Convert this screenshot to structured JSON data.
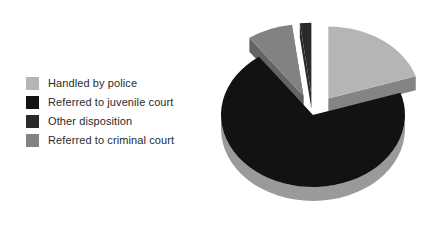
{
  "figure": {
    "background_color": "#ffffff",
    "type": "exploded-3d-pie-chart"
  },
  "legend": {
    "position": "left",
    "items": [
      {
        "label": "Handled by police",
        "color": "#b5b5b5",
        "swatch_name": "legend-swatch-handled-by-police"
      },
      {
        "label": "Referred to juvenile court",
        "color": "#121212",
        "swatch_name": "legend-swatch-referred-to-juvenile-court"
      },
      {
        "label": "Other disposition",
        "color": "#2a2a2a",
        "swatch_name": "legend-swatch-other-disposition"
      },
      {
        "label": "Referred to criminal court",
        "color": "#828282",
        "swatch_name": "legend-swatch-referred-to-criminal-court"
      }
    ]
  },
  "chart_data": {
    "type": "pie",
    "title": "",
    "subtitle": "",
    "xlabel": "",
    "ylabel": "",
    "grid": false,
    "legend_position": "left",
    "three_d": true,
    "exploded": true,
    "start_angle_deg": -90,
    "direction": "clockwise",
    "labels": [
      "Handled by police",
      "Other disposition",
      "Referred to criminal court",
      "Referred to juvenile court"
    ],
    "slices": [
      {
        "label": "Handled by police",
        "value": 20,
        "unit": "percent",
        "color": "#b5b5b5",
        "side_color": "#7d7d7d",
        "exploded": true,
        "start_angle_deg": 0,
        "end_angle_deg": 72
      },
      {
        "label": "Referred to juvenile court",
        "value": 70,
        "unit": "percent",
        "color": "#121212",
        "side_color": "#9a9a9a",
        "exploded": false,
        "start_angle_deg": 72,
        "end_angle_deg": 324
      },
      {
        "label": "Referred to criminal court",
        "value": 8,
        "unit": "percent",
        "color": "#828282",
        "side_color": "#5c5c5c",
        "exploded": true,
        "start_angle_deg": 324,
        "end_angle_deg": 352.8
      },
      {
        "label": "Other disposition",
        "value": 2,
        "unit": "percent",
        "color": "#2a2a2a",
        "side_color": "#1f1f1f",
        "exploded": true,
        "start_angle_deg": 352.8,
        "end_angle_deg": 360
      }
    ],
    "categories": [
      "Handled by police",
      "Referred to juvenile court",
      "Referred to criminal court",
      "Other disposition"
    ],
    "values": [
      20,
      70,
      8,
      2
    ]
  }
}
